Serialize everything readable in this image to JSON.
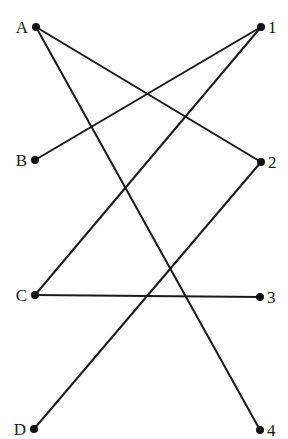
{
  "diagram": {
    "type": "bipartite-matching",
    "left_nodes": [
      {
        "id": "A",
        "label": "A",
        "x": 36,
        "y": 27
      },
      {
        "id": "B",
        "label": "B",
        "x": 35,
        "y": 160
      },
      {
        "id": "C",
        "label": "C",
        "x": 35,
        "y": 295
      },
      {
        "id": "D",
        "label": "D",
        "x": 34,
        "y": 429
      }
    ],
    "right_nodes": [
      {
        "id": "1",
        "label": "1",
        "x": 261,
        "y": 27
      },
      {
        "id": "2",
        "label": "2",
        "x": 261,
        "y": 162
      },
      {
        "id": "3",
        "label": "3",
        "x": 260,
        "y": 297
      },
      {
        "id": "4",
        "label": "4",
        "x": 260,
        "y": 430
      }
    ],
    "edges": [
      {
        "from": "A",
        "to": "2"
      },
      {
        "from": "A",
        "to": "4"
      },
      {
        "from": "B",
        "to": "1"
      },
      {
        "from": "C",
        "to": "1"
      },
      {
        "from": "C",
        "to": "3"
      },
      {
        "from": "D",
        "to": "2"
      }
    ]
  }
}
